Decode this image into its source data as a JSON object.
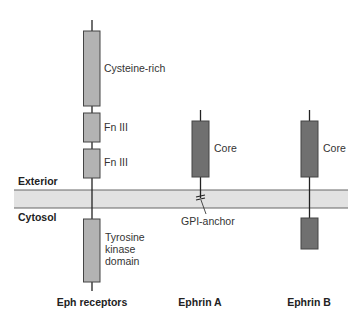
{
  "colors": {
    "receptor_fill": "#b3b3b3",
    "ephrin_fill": "#707070",
    "membrane_fill": "#e2e2e2",
    "line": "#222222"
  },
  "membrane": {
    "exterior_label": "Exterior",
    "cytosol_label": "Cytosol"
  },
  "eph_receptors": {
    "title": "Eph receptors",
    "domains": [
      {
        "label": "Cysteine-rich"
      },
      {
        "label": "Fn III"
      },
      {
        "label": "Fn III"
      },
      {
        "label_lines": [
          "Tyrosine",
          "kinase",
          "domain"
        ]
      }
    ]
  },
  "ephrin_a": {
    "title": "Ephrin A",
    "core_label": "Core",
    "anchor_label": "GPI-anchor"
  },
  "ephrin_b": {
    "title": "Ephrin B",
    "core_label": "Core"
  }
}
